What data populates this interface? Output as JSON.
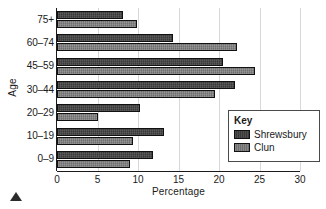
{
  "chart_data": {
    "type": "bar",
    "orientation": "horizontal",
    "title": "",
    "xlabel": "Percentage",
    "ylabel": "Age",
    "categories": [
      "0–9",
      "10–19",
      "20–29",
      "30–44",
      "45–59",
      "60–74",
      "75+"
    ],
    "series": [
      {
        "name": "Shrewsbury",
        "color": "#3a3a3a",
        "values": [
          11.8,
          13.2,
          10.3,
          22.0,
          20.5,
          14.3,
          8.2
        ]
      },
      {
        "name": "Clun",
        "color": "#707070",
        "values": [
          9.0,
          9.4,
          5.0,
          19.5,
          24.5,
          22.2,
          9.9
        ]
      }
    ],
    "xlim": [
      0,
      30
    ],
    "xticks": [
      0,
      5,
      10,
      15,
      20,
      25,
      30
    ],
    "xtick_labels": [
      "0",
      "5",
      "10",
      "15",
      "20",
      "25",
      "30"
    ],
    "grid": true,
    "grid_axis": "x",
    "legend_position": "right-middle"
  },
  "legend": {
    "title": "Key",
    "entries": [
      {
        "label": "Shrewsbury"
      },
      {
        "label": "Clun"
      }
    ]
  },
  "marker": {
    "name": "triangle-marker"
  }
}
